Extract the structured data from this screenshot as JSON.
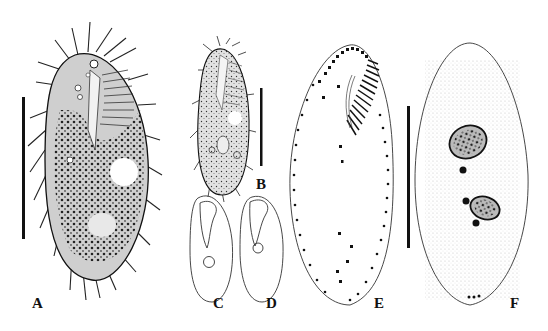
{
  "figure": {
    "panels": [
      {
        "id": "A",
        "label": "A",
        "description": "Ciliate in vivo, ventral view, densely granulated with cortical cirri and contractile vacuole"
      },
      {
        "id": "B",
        "label": "B",
        "description": "Ciliate in vivo, smaller specimen, ventral view"
      },
      {
        "id": "C",
        "label": "C",
        "description": "Outline sketch with adoral zone and nucleus"
      },
      {
        "id": "D",
        "label": "D",
        "description": "Outline sketch with adoral zone and nucleus"
      },
      {
        "id": "E",
        "label": "E",
        "description": "Ventral infraciliature with adoral membranelles and cirral rows"
      },
      {
        "id": "F",
        "label": "F",
        "description": "Dorsal view with two macronuclear nodules and micronuclei"
      }
    ],
    "scale_bars": [
      {
        "panel": "A",
        "orientation": "vertical"
      },
      {
        "panel": "B",
        "orientation": "vertical"
      },
      {
        "panel": "E-F",
        "orientation": "vertical"
      }
    ],
    "colors": {
      "ink": "#111111",
      "stipple": "#444444",
      "background": "#ffffff",
      "fill_light": "#d8d8d8"
    }
  }
}
